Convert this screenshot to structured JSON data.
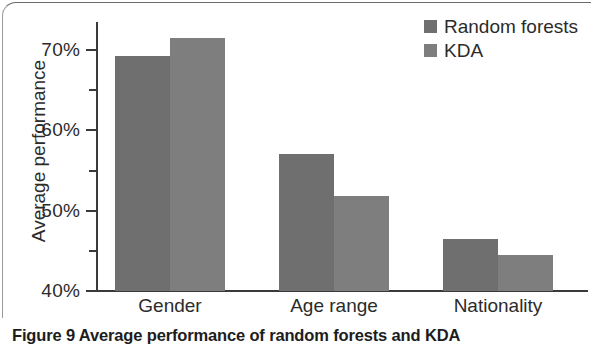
{
  "caption": {
    "label": "Figure 9",
    "text": "Average performance of random forests and KDA"
  },
  "chart_data": {
    "type": "bar",
    "title": "",
    "xlabel": "",
    "ylabel": "Average performance",
    "categories": [
      "Gender",
      "Age range",
      "Nationality"
    ],
    "series": [
      {
        "name": "Random forests",
        "color": "#6f6f6f",
        "values": [
          69.2,
          57.1,
          46.5
        ]
      },
      {
        "name": "KDA",
        "color": "#7e7e7e",
        "values": [
          71.5,
          51.8,
          44.5
        ]
      }
    ],
    "ylim": [
      40,
      75
    ],
    "ytick_values": [
      40,
      50,
      60,
      70
    ],
    "ytick_labels": [
      "40%",
      "50%",
      "60%",
      "70%"
    ],
    "yminor_values": [
      45,
      55,
      65
    ],
    "grid": false,
    "legend_position": "top-right",
    "legend_entries": [
      "Random forests",
      "KDA"
    ],
    "value_suffix": "%"
  }
}
